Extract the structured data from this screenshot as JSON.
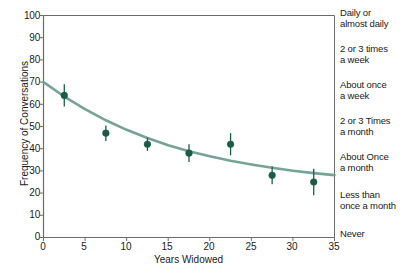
{
  "chart_data": {
    "type": "scatter",
    "title": "",
    "xlabel": "Years Widowed",
    "ylabel": "Frequency of Conversations",
    "xlim": [
      0,
      35
    ],
    "ylim": [
      0,
      100
    ],
    "xticks": [
      0,
      5,
      10,
      15,
      20,
      25,
      30,
      35
    ],
    "yticks": [
      0,
      10,
      20,
      30,
      40,
      50,
      60,
      70,
      80,
      90,
      100
    ],
    "grid": false,
    "legend": "right-category-axis",
    "series": [
      {
        "name": "Observed means with error bars",
        "type": "scatter",
        "marker": "circle",
        "color": "#1b5c48",
        "x": [
          2.5,
          7.5,
          12.5,
          17.5,
          22.5,
          27.5,
          32.5
        ],
        "y": [
          64,
          47,
          42,
          38,
          42,
          28,
          25
        ],
        "yerr": [
          5,
          3.5,
          3,
          4,
          5,
          4,
          6
        ]
      },
      {
        "name": "Fitted decay curve",
        "type": "line",
        "color": "#6f9e90",
        "x": [
          0,
          2.5,
          5,
          7.5,
          10,
          12.5,
          15,
          17.5,
          20,
          22.5,
          25,
          27.5,
          30,
          32.5,
          35
        ],
        "y": [
          70,
          63.5,
          57.8,
          52.8,
          48.5,
          44.8,
          41.6,
          38.9,
          36.6,
          34.6,
          32.9,
          31.4,
          30.1,
          29.0,
          28.1
        ]
      }
    ],
    "right_axis_categories": [
      {
        "label_line1": "Daily or",
        "label_line2": "almost daily",
        "y_value": 100
      },
      {
        "label_line1": "2 or 3 times",
        "label_line2": "a week",
        "y_value": 85
      },
      {
        "label_line1": "About once",
        "label_line2": "a week",
        "y_value": 70
      },
      {
        "label_line1": "2 or 3 Times",
        "label_line2": "a month",
        "y_value": 55
      },
      {
        "label_line1": "About Once",
        "label_line2": "a month",
        "y_value": 40
      },
      {
        "label_line1": "Less than",
        "label_line2": "once a month",
        "y_value": 22
      },
      {
        "label_line1": "Never",
        "label_line2": "",
        "y_value": 3
      }
    ]
  },
  "colors": {
    "marker": "#1b5c48",
    "curve": "#6f9e90",
    "axis": "#6b6b6b",
    "text": "#1a1a1a",
    "background": "#ffffff"
  },
  "axes": {
    "y_tick_labels": [
      "100",
      "90",
      "80",
      "70",
      "60",
      "50",
      "40",
      "30",
      "20",
      "10",
      "0"
    ],
    "x_tick_labels": [
      "0",
      "5",
      "10",
      "15",
      "20",
      "25",
      "30",
      "35"
    ],
    "x_title": "Years Widowed",
    "y_title": "Frequency of Conversations"
  },
  "right_labels": [
    "Daily or",
    "almost daily",
    "2 or 3 times",
    "a week",
    "About once",
    "a week",
    "2 or 3 Times",
    "a month",
    "About Once",
    "a month",
    "Less than",
    "once a month",
    "Never"
  ]
}
